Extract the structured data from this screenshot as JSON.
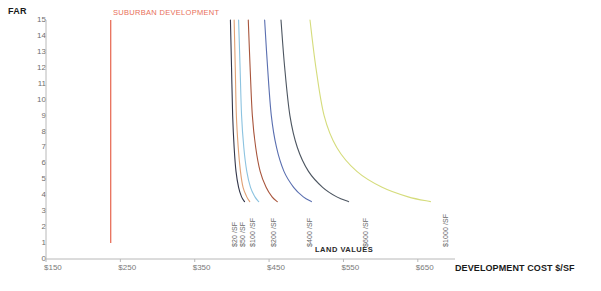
{
  "chart_data": {
    "type": "line",
    "title": "",
    "xlabel": "DEVELOPMENT COST $/SF",
    "ylabel": "FAR",
    "xlim": [
      150,
      700
    ],
    "ylim": [
      0,
      15
    ],
    "grid": false,
    "legend_position": "inline-rotated-labels",
    "x_ticks": [
      "$150",
      "$250",
      "$350",
      "$450",
      "$550",
      "$650"
    ],
    "x_tick_values": [
      150,
      250,
      350,
      450,
      550,
      650
    ],
    "y_ticks": [
      "0",
      "1",
      "2",
      "3",
      "4",
      "5",
      "6",
      "7",
      "8",
      "9",
      "10",
      "11",
      "12",
      "13",
      "14",
      "15"
    ],
    "y_tick_values": [
      0,
      1,
      2,
      3,
      4,
      5,
      6,
      7,
      8,
      9,
      10,
      11,
      12,
      13,
      14,
      15
    ],
    "group_label": "LAND VALUES",
    "annotations": [
      {
        "name": "suburban-development",
        "text": "SUBURBAN DEVELOPMENT",
        "type": "vertical-line",
        "x_value": 237,
        "y_from": 1,
        "y_to": 15,
        "color": "#e8705a"
      }
    ],
    "series": [
      {
        "name": "$20 /SF",
        "color": "#33364a",
        "points": [
          [
            398,
            15
          ],
          [
            399.5,
            12
          ],
          [
            401,
            9
          ],
          [
            403,
            7
          ],
          [
            405.5,
            5.5
          ],
          [
            409,
            4.5
          ],
          [
            413,
            3.9
          ],
          [
            417,
            3.6
          ]
        ]
      },
      {
        "name": "$50 /SF",
        "color": "#e0a074",
        "points": [
          [
            403,
            15
          ],
          [
            404.5,
            12
          ],
          [
            406,
            9
          ],
          [
            408.5,
            7
          ],
          [
            411.5,
            5.5
          ],
          [
            415,
            4.5
          ],
          [
            420,
            3.9
          ],
          [
            424,
            3.6
          ]
        ]
      },
      {
        "name": "$100 /SF",
        "color": "#8cc3e0",
        "points": [
          [
            409,
            15
          ],
          [
            411,
            12
          ],
          [
            413,
            9
          ],
          [
            416,
            7
          ],
          [
            420,
            5.5
          ],
          [
            425,
            4.5
          ],
          [
            431,
            3.9
          ],
          [
            436,
            3.6
          ]
        ]
      },
      {
        "name": "$200 /SF",
        "color": "#a8553c",
        "points": [
          [
            422,
            15
          ],
          [
            424.5,
            12
          ],
          [
            427.5,
            9
          ],
          [
            432,
            7
          ],
          [
            438,
            5.5
          ],
          [
            446,
            4.5
          ],
          [
            454,
            3.9
          ],
          [
            461,
            3.6
          ]
        ]
      },
      {
        "name": "$400 /SF",
        "color": "#5a6fb0",
        "points": [
          [
            444,
            15
          ],
          [
            448,
            12
          ],
          [
            453,
            9
          ],
          [
            460,
            7
          ],
          [
            470,
            5.5
          ],
          [
            483,
            4.5
          ],
          [
            496,
            3.9
          ],
          [
            507,
            3.6
          ]
        ]
      },
      {
        "name": "$600 /SF",
        "color": "#4c5560",
        "points": [
          [
            466,
            15
          ],
          [
            471,
            12
          ],
          [
            478,
            9
          ],
          [
            488,
            7
          ],
          [
            503,
            5.5
          ],
          [
            522,
            4.5
          ],
          [
            541,
            3.9
          ],
          [
            557,
            3.6
          ]
        ]
      },
      {
        "name": "$1000 /SF",
        "color": "#d5dc7c",
        "points": [
          [
            505,
            15
          ],
          [
            513,
            12
          ],
          [
            524,
            9
          ],
          [
            541,
            7
          ],
          [
            568,
            5.5
          ],
          [
            602,
            4.5
          ],
          [
            637,
            3.9
          ],
          [
            667,
            3.6
          ]
        ]
      }
    ]
  },
  "axes": {
    "far_title": "FAR",
    "x_title": "DEVELOPMENT COST $/SF"
  },
  "curve_labels": [
    {
      "text": "$20 /SF",
      "x": 231,
      "y": 247
    },
    {
      "text": "$50 /SF",
      "x": 239,
      "y": 247
    },
    {
      "text": "$100 /SF",
      "x": 249,
      "y": 247
    },
    {
      "text": "$200 /SF",
      "x": 270,
      "y": 247
    },
    {
      "text": "$400 /SF",
      "x": 306,
      "y": 247
    },
    {
      "text": "$600 /SF",
      "x": 362,
      "y": 247
    },
    {
      "text": "$1000 /SF",
      "x": 442,
      "y": 247
    }
  ]
}
